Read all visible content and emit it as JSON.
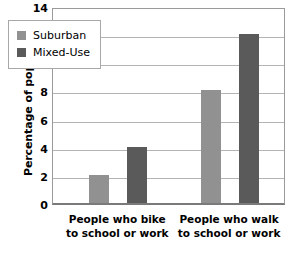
{
  "chart_data": {
    "type": "bar",
    "title": "",
    "xlabel": "",
    "ylabel": "Percentage of population",
    "categories": [
      "People who bike\nto school or work",
      "People who walk\nto school or work"
    ],
    "category_lines": [
      [
        "People who bike",
        "to school or work"
      ],
      [
        "People who walk",
        "to school or work"
      ]
    ],
    "series": [
      {
        "name": "Suburban",
        "color": "#919191",
        "values": [
          2,
          8
        ]
      },
      {
        "name": "Mixed-Use",
        "color": "#5a5a5a",
        "values": [
          4,
          12
        ]
      }
    ],
    "ylim": [
      0,
      14
    ],
    "yticks": [
      0,
      2,
      4,
      6,
      8,
      10,
      12,
      14
    ],
    "ytick_labels": [
      "0",
      "2",
      "4",
      "6",
      "8",
      "10",
      "12",
      "14"
    ],
    "grid": true,
    "grid_axis": "y",
    "legend_position": "upper left",
    "colors": {
      "suburban": "#919191",
      "mixed_use": "#5a5a5a",
      "gridline": "#b4b4b4",
      "frame": "#9a9a9a",
      "axis": "#7a7a7a",
      "background": "#ffffff",
      "text": "#000000"
    }
  }
}
